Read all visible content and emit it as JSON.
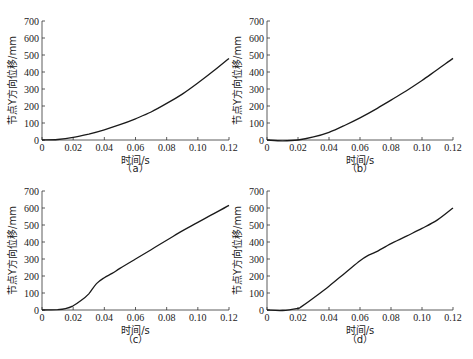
{
  "chart_data": [
    {
      "type": "line",
      "panel": "(a)",
      "caption": "（a）",
      "xlabel": "时间/s",
      "ylabel": "节点Y方向位移/mm",
      "xlim": [
        0,
        0.12
      ],
      "ylim": [
        0,
        700
      ],
      "xticks": [
        "0",
        "0.02",
        "0.04",
        "0.06",
        "0.08",
        "0.10",
        "0.12"
      ],
      "yticks": [
        "0",
        "100",
        "200",
        "300",
        "400",
        "500",
        "600",
        "700"
      ],
      "grid": false,
      "series": [
        {
          "name": "displacement",
          "x": [
            0,
            0.01,
            0.02,
            0.03,
            0.04,
            0.05,
            0.06,
            0.07,
            0.08,
            0.09,
            0.1,
            0.11,
            0.12
          ],
          "y": [
            0,
            3,
            15,
            35,
            60,
            90,
            125,
            165,
            215,
            270,
            335,
            405,
            480
          ]
        }
      ]
    },
    {
      "type": "line",
      "panel": "(b)",
      "caption": "（b）",
      "xlabel": "时间/s",
      "ylabel": "节点Y方向位移/mm",
      "xlim": [
        0,
        0.12
      ],
      "ylim": [
        0,
        700
      ],
      "xticks": [
        "0",
        "0.02",
        "0.04",
        "0.06",
        "0.08",
        "0.10",
        "0.12"
      ],
      "yticks": [
        "0",
        "100",
        "200",
        "300",
        "400",
        "500",
        "600",
        "700"
      ],
      "grid": false,
      "series": [
        {
          "name": "displacement",
          "x": [
            0,
            0.01,
            0.02,
            0.03,
            0.04,
            0.05,
            0.06,
            0.07,
            0.08,
            0.09,
            0.1,
            0.11,
            0.12
          ],
          "y": [
            0,
            -5,
            0,
            18,
            45,
            85,
            130,
            180,
            235,
            290,
            350,
            415,
            480
          ]
        }
      ]
    },
    {
      "type": "line",
      "panel": "(c)",
      "caption": "（c）",
      "xlabel": "时间/s",
      "ylabel": "节点Y方向位移/mm",
      "xlim": [
        0,
        0.12
      ],
      "ylim": [
        0,
        700
      ],
      "xticks": [
        "0",
        "0.02",
        "0.04",
        "0.06",
        "0.08",
        "0.10",
        "0.12"
      ],
      "yticks": [
        "0",
        "100",
        "200",
        "300",
        "400",
        "500",
        "600",
        "700"
      ],
      "grid": false,
      "series": [
        {
          "name": "displacement",
          "x": [
            0,
            0.01,
            0.015,
            0.02,
            0.025,
            0.03,
            0.035,
            0.04,
            0.045,
            0.05,
            0.06,
            0.07,
            0.08,
            0.09,
            0.1,
            0.11,
            0.12
          ],
          "y": [
            0,
            2,
            8,
            25,
            55,
            95,
            155,
            190,
            215,
            245,
            300,
            355,
            410,
            465,
            515,
            565,
            615
          ]
        }
      ]
    },
    {
      "type": "line",
      "panel": "(d)",
      "caption": "（d）",
      "xlabel": "时间/s",
      "ylabel": "节点Y方向位移/mm",
      "xlim": [
        0,
        0.12
      ],
      "ylim": [
        0,
        700
      ],
      "xticks": [
        "0",
        "0.02",
        "0.04",
        "0.06",
        "0.08",
        "0.10",
        "0.12"
      ],
      "yticks": [
        "0",
        "100",
        "200",
        "300",
        "400",
        "500",
        "600",
        "700"
      ],
      "grid": false,
      "series": [
        {
          "name": "displacement",
          "x": [
            0,
            0.01,
            0.02,
            0.022,
            0.03,
            0.04,
            0.05,
            0.06,
            0.065,
            0.07,
            0.08,
            0.09,
            0.1,
            0.11,
            0.12
          ],
          "y": [
            0,
            -3,
            10,
            18,
            70,
            140,
            215,
            290,
            320,
            340,
            390,
            435,
            480,
            530,
            600
          ]
        }
      ]
    }
  ]
}
